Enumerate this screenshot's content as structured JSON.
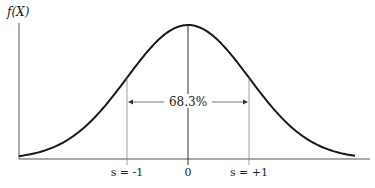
{
  "chart_data": {
    "type": "line",
    "title": "",
    "ylabel": "f(X)",
    "xlabel": "",
    "distribution": "normal",
    "mean": 0,
    "sd": 1,
    "xlim": [
      -3.2,
      3.2
    ],
    "x_ticks": [
      {
        "value": -1,
        "label": "s = -1"
      },
      {
        "value": 0,
        "label": "0"
      },
      {
        "value": 1,
        "label": "s = +1"
      }
    ],
    "annotations": [
      {
        "type": "span-arrow",
        "from": -1,
        "to": 1,
        "label": "68.3%"
      },
      {
        "type": "vline",
        "x": 0,
        "label": "mean"
      }
    ]
  },
  "colors": {
    "curve": "#1a1a1a",
    "axis": "#555555",
    "guide": "#888888",
    "text": "#222222"
  }
}
